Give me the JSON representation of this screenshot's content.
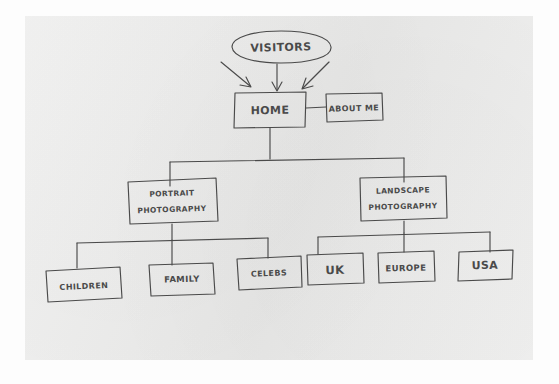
{
  "diagram": {
    "medium": "hand-drawn pencil on paper",
    "ink_color": "#4a4a4a",
    "paper_color": "#ececeb",
    "background_color": "#fdfdfd",
    "nodes": {
      "visitors": {
        "label": "VISITORS",
        "shape": "ellipse"
      },
      "home": {
        "label": "HOME",
        "shape": "rectangle"
      },
      "about": {
        "label": "ABOUT ME",
        "shape": "rectangle"
      },
      "portrait": {
        "label_line1": "PORTRAIT",
        "label_line2": "PHOTOGRAPHY",
        "shape": "rectangle"
      },
      "landscape": {
        "label_line1": "LANDSCAPE",
        "label_line2": "PHOTOGRAPHY",
        "shape": "rectangle"
      },
      "children": {
        "label": "CHILDREN",
        "shape": "rectangle"
      },
      "family": {
        "label": "FAMILY",
        "shape": "rectangle"
      },
      "celebs": {
        "label": "CELEBS",
        "shape": "rectangle"
      },
      "uk": {
        "label": "UK",
        "shape": "rectangle"
      },
      "europe": {
        "label": "EUROPE",
        "shape": "rectangle"
      },
      "usa": {
        "label": "USA",
        "shape": "rectangle"
      }
    },
    "edges": [
      {
        "from": "visitors",
        "to": "home",
        "style": "arrow-left-diagonal"
      },
      {
        "from": "visitors",
        "to": "home",
        "style": "arrow-vertical"
      },
      {
        "from": "visitors",
        "to": "home",
        "style": "arrow-right-diagonal"
      },
      {
        "from": "home",
        "to": "about",
        "style": "line-horizontal"
      },
      {
        "from": "home",
        "to": "portrait",
        "style": "line-elbow"
      },
      {
        "from": "home",
        "to": "landscape",
        "style": "line-elbow"
      },
      {
        "from": "portrait",
        "to": "children",
        "style": "line-elbow"
      },
      {
        "from": "portrait",
        "to": "family",
        "style": "line-elbow"
      },
      {
        "from": "portrait",
        "to": "celebs",
        "style": "line-elbow"
      },
      {
        "from": "landscape",
        "to": "uk",
        "style": "line-elbow"
      },
      {
        "from": "landscape",
        "to": "europe",
        "style": "line-elbow"
      },
      {
        "from": "landscape",
        "to": "usa",
        "style": "line-elbow"
      }
    ]
  }
}
